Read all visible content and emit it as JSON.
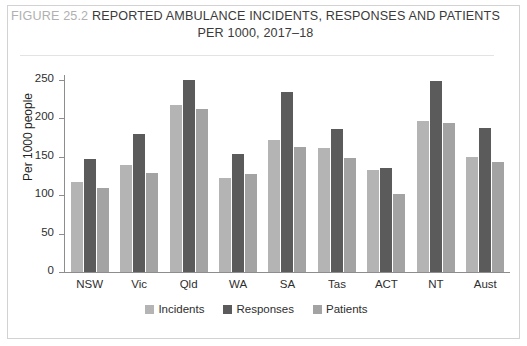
{
  "figure": {
    "number_label": "FIGURE 25.2",
    "title_line1": "REPORTED AMBULANCE INCIDENTS, RESPONSES AND PATIENTS",
    "title_line2": "PER 1000, 2017–18"
  },
  "colors": {
    "incidents": "#b4b4b4",
    "responses": "#5b5b5b",
    "patients": "#a3a3a3",
    "axis": "#8d8d8d",
    "border": "#d2d2d2",
    "figure_number_text": "#b0b0b0",
    "title_text": "#3a3a3a"
  },
  "chart_data": {
    "type": "bar",
    "title": "FIGURE 25.2 REPORTED AMBULANCE INCIDENTS, RESPONSES AND PATIENTS PER 1000, 2017–18",
    "xlabel": "",
    "ylabel": "Per 1000 people",
    "ylim": [
      0,
      250
    ],
    "yticks": [
      0,
      50,
      100,
      150,
      200,
      250
    ],
    "ytick_labels": [
      "0",
      "50",
      "100",
      "150",
      "200",
      "250"
    ],
    "grid": false,
    "legend_position": "bottom-center",
    "categories": [
      "NSW",
      "Vic",
      "Qld",
      "WA",
      "SA",
      "Tas",
      "ACT",
      "NT",
      "Aust"
    ],
    "series": [
      {
        "name": "Incidents",
        "color": "#b4b4b4",
        "values": [
          117,
          139,
          218,
          123,
          172,
          162,
          133,
          197,
          150
        ]
      },
      {
        "name": "Responses",
        "color": "#5b5b5b",
        "values": [
          147,
          180,
          250,
          154,
          234,
          186,
          135,
          249,
          187
        ]
      },
      {
        "name": "Patients",
        "color": "#a3a3a3",
        "values": [
          110,
          129,
          212,
          128,
          163,
          148,
          101,
          194,
          143
        ]
      }
    ]
  }
}
